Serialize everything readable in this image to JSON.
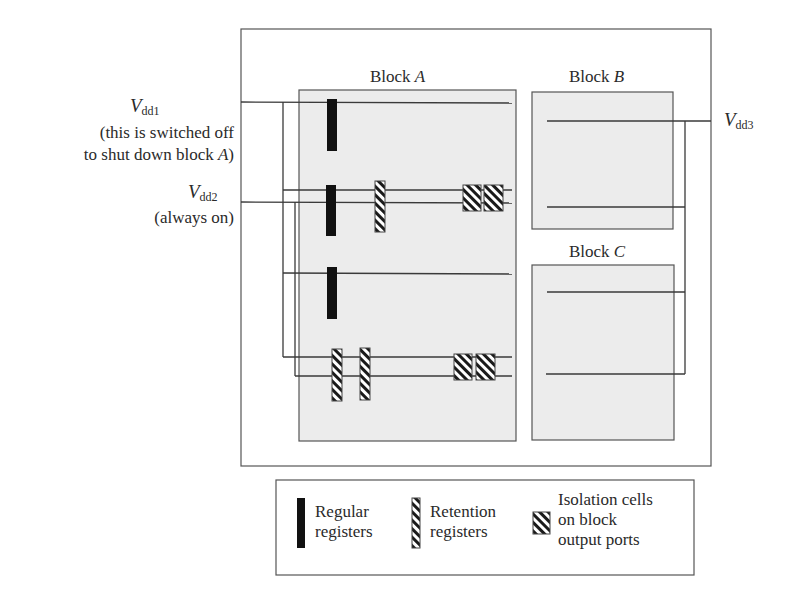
{
  "diagram": {
    "supplies": [
      {
        "id": "vdd1",
        "symbol": "V",
        "subscript": "dd1",
        "note_line1": "(this is switched off",
        "note_line2": "to shut down block ",
        "note_line2_italic": "A",
        "note_line2_end": ")"
      },
      {
        "id": "vdd2",
        "symbol": "V",
        "subscript": "dd2",
        "note_line1": "(always on)"
      },
      {
        "id": "vdd3",
        "symbol": "V",
        "subscript": "dd3"
      }
    ],
    "blocks": [
      {
        "id": "A",
        "prefix": "Block ",
        "name": "A"
      },
      {
        "id": "B",
        "prefix": "Block ",
        "name": "B"
      },
      {
        "id": "C",
        "prefix": "Block ",
        "name": "C"
      }
    ],
    "colors": {
      "block_fill": "#ececec",
      "line": "#3a3a3a",
      "register": "#111111",
      "hatch_bg": "#ffffff"
    },
    "registers": {
      "regular_count": 3,
      "retention_count": 3,
      "isolation_cell_count": 4
    }
  },
  "legend": {
    "items": [
      {
        "icon": "regular-register-icon",
        "line1": "Regular",
        "line2": "registers"
      },
      {
        "icon": "retention-register-icon",
        "line1": "Retention",
        "line2": "registers"
      },
      {
        "icon": "isolation-cell-icon",
        "line1": "Isolation cells",
        "line2": "on block",
        "line3": "output ports"
      }
    ]
  }
}
